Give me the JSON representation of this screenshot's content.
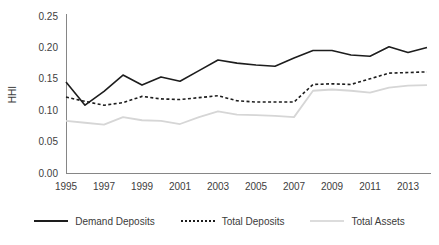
{
  "figure": {
    "clipped_header_text": "",
    "background_color": "#ffffff"
  },
  "legend": {
    "position": "bottom",
    "items": [
      {
        "label": "Demand Deposits",
        "style": "solid",
        "color": "#1d1d1d",
        "icon": "line-swatch-icon"
      },
      {
        "label": "Total Deposits",
        "style": "dotted",
        "color": "#1d1d1d",
        "icon": "line-swatch-icon"
      },
      {
        "label": "Total Assets",
        "style": "solid",
        "color": "#dcdcdc",
        "icon": "line-swatch-icon"
      }
    ]
  },
  "chart_data": {
    "type": "line",
    "title": "",
    "xlabel": "",
    "ylabel": "HHI",
    "ylim": [
      0.0,
      0.25
    ],
    "xlim": [
      1995,
      2014
    ],
    "grid": false,
    "legend_position": "bottom",
    "ytick_labels": [
      "0.25",
      "0.20",
      "0.15",
      "0.10",
      "0.05",
      "0.00"
    ],
    "ytick_values": [
      0.25,
      0.2,
      0.15,
      0.1,
      0.05,
      0.0
    ],
    "xtick_labels": [
      "1995",
      "1997",
      "1999",
      "2001",
      "2003",
      "2005",
      "2007",
      "2009",
      "2011",
      "2013"
    ],
    "xtick_values": [
      1995,
      1997,
      1999,
      2001,
      2003,
      2005,
      2007,
      2009,
      2011,
      2013
    ],
    "x": [
      1995,
      1996,
      1997,
      1998,
      1999,
      2000,
      2001,
      2002,
      2003,
      2004,
      2005,
      2006,
      2007,
      2008,
      2009,
      2010,
      2011,
      2012,
      2013,
      2014
    ],
    "series": [
      {
        "name": "Demand Deposits",
        "color": "#1d1d1d",
        "style": "solid",
        "values": [
          0.145,
          0.108,
          0.13,
          0.156,
          0.14,
          0.153,
          0.146,
          0.163,
          0.18,
          0.175,
          0.172,
          0.17,
          0.183,
          0.195,
          0.195,
          0.188,
          0.186,
          0.201,
          0.192,
          0.2
        ]
      },
      {
        "name": "Total Deposits",
        "color": "#1d1d1d",
        "style": "dotted",
        "values": [
          0.121,
          0.114,
          0.108,
          0.112,
          0.122,
          0.118,
          0.117,
          0.12,
          0.123,
          0.115,
          0.113,
          0.113,
          0.113,
          0.141,
          0.142,
          0.141,
          0.15,
          0.159,
          0.16,
          0.161
        ]
      },
      {
        "name": "Total Assets",
        "color": "#dcdcdc",
        "style": "solid",
        "values": [
          0.083,
          0.08,
          0.077,
          0.089,
          0.084,
          0.083,
          0.078,
          0.089,
          0.098,
          0.093,
          0.092,
          0.091,
          0.089,
          0.131,
          0.133,
          0.131,
          0.128,
          0.136,
          0.139,
          0.14
        ]
      }
    ]
  }
}
